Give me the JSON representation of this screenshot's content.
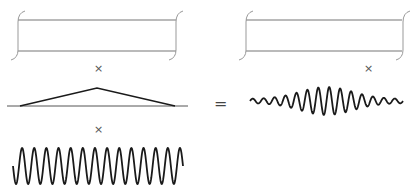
{
  "diagram": {
    "operators": {
      "times_1": "×",
      "times_2": "×",
      "times_3": "×",
      "equals": "="
    },
    "colors": {
      "stroke_dark": "#1a1a1a",
      "stroke_gray": "#777777",
      "bracket": "#999999",
      "text": "#555555"
    },
    "panels": [
      {
        "id": "left-box",
        "type": "bracketed-rectangle",
        "x": [
          18,
          176
        ],
        "y": [
          20,
          51
        ]
      },
      {
        "id": "right-box",
        "type": "bracketed-rectangle",
        "x": [
          240,
          402
        ],
        "y": [
          20,
          51
        ]
      },
      {
        "id": "triangle-envelope",
        "type": "triangle",
        "base": [
          20,
          175
        ],
        "peak": [
          97,
          88
        ],
        "baseline_y": 106
      },
      {
        "id": "carrier-sine",
        "type": "sine",
        "x": [
          13,
          183
        ],
        "center_y": 166,
        "amplitude": 18,
        "periods": 14
      },
      {
        "id": "wave-packet",
        "type": "modulated-sine",
        "x": [
          250,
          403
        ],
        "center_y": 101,
        "max_amplitude": 14,
        "periods": 14
      }
    ]
  }
}
